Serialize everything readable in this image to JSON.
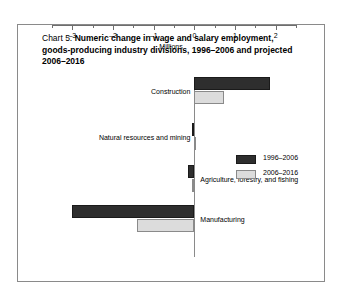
{
  "figure": {
    "chart_number": "Chart 5.",
    "title": "Numeric change in wage and salary employment, goods-producing industry divisions, 1996–2006 and projected 2006–2016"
  },
  "chart_data": {
    "type": "bar",
    "orientation": "horizontal",
    "title": "Chart 5. Numeric change in wage and salary employment, goods-producing industry divisions, 1996–2006 and projected 2006–2016",
    "xlabel": "Millions",
    "ylabel": "",
    "xlim": [
      -3.5,
      2.5
    ],
    "grid": false,
    "legend_position": "center-right",
    "xticks": [
      -3,
      -2,
      -1,
      0,
      1,
      2
    ],
    "xtick_labels": [
      "–3",
      "–2",
      "–1",
      "0",
      "1",
      "2"
    ],
    "minor_xticks": [
      -3.5,
      -2.5,
      -1.5,
      -0.5,
      0.5,
      1.5,
      2.5
    ],
    "categories": [
      "Construction",
      "Natural resources and mining",
      "Agriculture, forestry, and fishing",
      "Manufacturing"
    ],
    "series": [
      {
        "name": "1996–2006",
        "color": "#2e2e2e",
        "values": [
          1.85,
          -0.05,
          -0.15,
          -3.0
        ]
      },
      {
        "name": "2006–2016",
        "color": "#dcdcdc",
        "values": [
          0.73,
          0.0,
          -0.05,
          -1.4
        ]
      }
    ],
    "label_side": [
      "left",
      "left",
      "right",
      "right"
    ]
  }
}
